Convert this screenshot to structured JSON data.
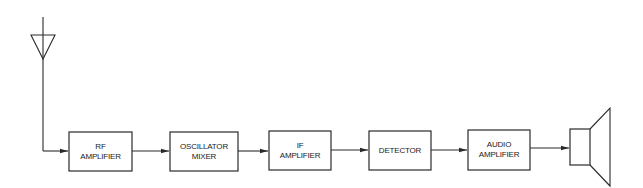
{
  "diagram": {
    "type": "block-diagram",
    "title": "",
    "antenna": {
      "label": ""
    },
    "blocks": [
      {
        "id": "rf",
        "lines": [
          "RF",
          "AMPLIFIER"
        ]
      },
      {
        "id": "osc",
        "lines": [
          "OSCILLATOR",
          "MIXER"
        ]
      },
      {
        "id": "if",
        "lines": [
          "IF",
          "AMPLIFIER"
        ]
      },
      {
        "id": "det",
        "lines": [
          "DETECTOR"
        ]
      },
      {
        "id": "audio",
        "lines": [
          "AUDIO",
          "AMPLIFIER"
        ]
      }
    ],
    "speaker": {
      "label": ""
    },
    "colors": {
      "stroke": "#2a2a2a",
      "background": "#ffffff"
    }
  }
}
